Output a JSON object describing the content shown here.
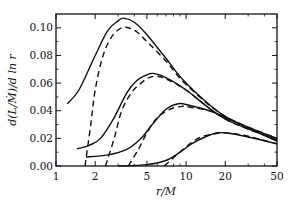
{
  "chart_data": {
    "type": "line",
    "title": "",
    "xlabel": "r/M",
    "ylabel": "d(L/Ṁ)/d ln r",
    "xscale": "log",
    "xlim": [
      1,
      50
    ],
    "ylim": [
      0.0,
      0.11
    ],
    "xticks": [
      1,
      2,
      5,
      10,
      20,
      50
    ],
    "xtick_labels": [
      "1",
      "2",
      "5",
      "10",
      "20",
      "50"
    ],
    "yticks": [
      0.0,
      0.02,
      0.04,
      0.06,
      0.08,
      0.1
    ],
    "ytick_labels": [
      "0.00",
      "0.02",
      "0.04",
      "0.06",
      "0.08",
      "0.10"
    ],
    "grid": false,
    "legend": null,
    "series": [
      {
        "name": "curve-1-solid",
        "style": "solid",
        "x": [
          1.22,
          1.5,
          2.0,
          2.5,
          3.0,
          3.3,
          4.0,
          5.0,
          7.0,
          10,
          20,
          50
        ],
        "y": [
          0.045,
          0.055,
          0.08,
          0.098,
          0.105,
          0.107,
          0.104,
          0.095,
          0.078,
          0.06,
          0.036,
          0.02
        ]
      },
      {
        "name": "curve-1-dashed",
        "style": "dashed",
        "x": [
          1.67,
          1.85,
          2.0,
          2.3,
          2.7,
          3.2,
          3.6,
          4.2,
          5.0,
          7.0,
          10,
          20,
          50
        ],
        "y": [
          0.0,
          0.03,
          0.055,
          0.08,
          0.094,
          0.1,
          0.1,
          0.097,
          0.09,
          0.076,
          0.059,
          0.036,
          0.02
        ]
      },
      {
        "name": "curve-2-solid",
        "style": "solid",
        "x": [
          1.45,
          1.8,
          2.2,
          2.8,
          3.5,
          4.2,
          5.0,
          5.6,
          7.0,
          10,
          20,
          50
        ],
        "y": [
          0.0125,
          0.015,
          0.02,
          0.035,
          0.053,
          0.062,
          0.066,
          0.067,
          0.064,
          0.055,
          0.034,
          0.019
        ]
      },
      {
        "name": "curve-2-dashed",
        "style": "dashed",
        "x": [
          2.4,
          2.8,
          3.2,
          3.8,
          4.5,
          5.2,
          6.0,
          7.0,
          10,
          20,
          50
        ],
        "y": [
          0.0,
          0.02,
          0.04,
          0.053,
          0.06,
          0.064,
          0.065,
          0.063,
          0.055,
          0.034,
          0.019
        ]
      },
      {
        "name": "curve-3-solid",
        "style": "solid",
        "x": [
          1.7,
          2.5,
          3.5,
          4.5,
          5.5,
          7.0,
          8.7,
          10,
          15,
          20,
          50
        ],
        "y": [
          0.0065,
          0.008,
          0.012,
          0.02,
          0.03,
          0.041,
          0.045,
          0.0445,
          0.04,
          0.035,
          0.018
        ]
      },
      {
        "name": "curve-3-dashed",
        "style": "dashed",
        "x": [
          3.6,
          4.3,
          5.0,
          6.0,
          7.5,
          9.0,
          10,
          15,
          20,
          50
        ],
        "y": [
          0.0,
          0.012,
          0.024,
          0.035,
          0.041,
          0.043,
          0.043,
          0.04,
          0.035,
          0.018
        ]
      },
      {
        "name": "curve-4-solid",
        "style": "solid",
        "x": [
          3.0,
          5.0,
          7.0,
          9.0,
          11,
          14,
          17.6,
          22,
          30,
          50
        ],
        "y": [
          0.0,
          0.001,
          0.004,
          0.01,
          0.016,
          0.021,
          0.024,
          0.0235,
          0.021,
          0.016
        ]
      },
      {
        "name": "curve-4-dashed",
        "style": "dashed",
        "x": [
          6.8,
          8.0,
          9.5,
          11,
          13,
          16,
          19,
          25,
          35,
          50
        ],
        "y": [
          0.0,
          0.006,
          0.012,
          0.017,
          0.021,
          0.023,
          0.024,
          0.023,
          0.02,
          0.016
        ]
      }
    ]
  }
}
